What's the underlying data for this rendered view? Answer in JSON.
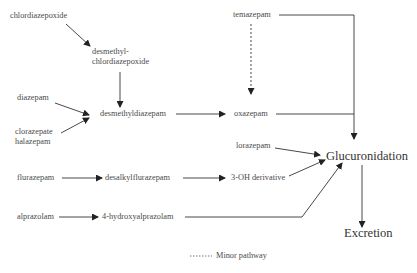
{
  "diagram": {
    "nodes": {
      "chlordiazepoxide": "chlordiazepoxide",
      "desmethyl_line1": "desmethyl-",
      "desmethyl_line2": "chlordiazepoxide",
      "diazepam": "diazepam",
      "clorazepate": "clorazepate",
      "halazepam": "halazepam",
      "desmethyldiazepam": "desmethyldiazepam",
      "temazepam": "temazepam",
      "oxazepam": "oxazepam",
      "lorazepam": "lorazepam",
      "flurazepam": "flurazepam",
      "desalkylflurazepam": "desalkylflurazepam",
      "three_oh_derivative": "3-OH derivative",
      "alprazolam": "alprazolam",
      "hydroxyalprazolam": "4-hydroxyalprazolam",
      "glucuronidation": "Glucuronidation",
      "excretion": "Excretion"
    },
    "legend": {
      "minor_pathway": "Minor pathway"
    },
    "edges": [
      {
        "from": "chlordiazepoxide",
        "to": "desmethylchlordiazepoxide",
        "style": "solid"
      },
      {
        "from": "desmethylchlordiazepoxide",
        "to": "desmethyldiazepam",
        "style": "solid"
      },
      {
        "from": "diazepam",
        "to": "desmethyldiazepam",
        "style": "solid"
      },
      {
        "from": "clorazepate/halazepam",
        "to": "desmethyldiazepam",
        "style": "solid"
      },
      {
        "from": "desmethyldiazepam",
        "to": "oxazepam",
        "style": "solid"
      },
      {
        "from": "temazepam",
        "to": "oxazepam",
        "style": "dashed"
      },
      {
        "from": "temazepam",
        "to": "Glucuronidation",
        "style": "solid"
      },
      {
        "from": "oxazepam",
        "to": "Glucuronidation",
        "style": "solid"
      },
      {
        "from": "lorazepam",
        "to": "Glucuronidation",
        "style": "solid"
      },
      {
        "from": "flurazepam",
        "to": "desalkylflurazepam",
        "style": "solid"
      },
      {
        "from": "desalkylflurazepam",
        "to": "3-OH derivative",
        "style": "solid"
      },
      {
        "from": "3-OH derivative",
        "to": "Glucuronidation",
        "style": "solid"
      },
      {
        "from": "alprazolam",
        "to": "4-hydroxyalprazolam",
        "style": "solid"
      },
      {
        "from": "4-hydroxyalprazolam",
        "to": "Glucuronidation",
        "style": "solid"
      },
      {
        "from": "Glucuronidation",
        "to": "Excretion",
        "style": "solid"
      }
    ]
  }
}
